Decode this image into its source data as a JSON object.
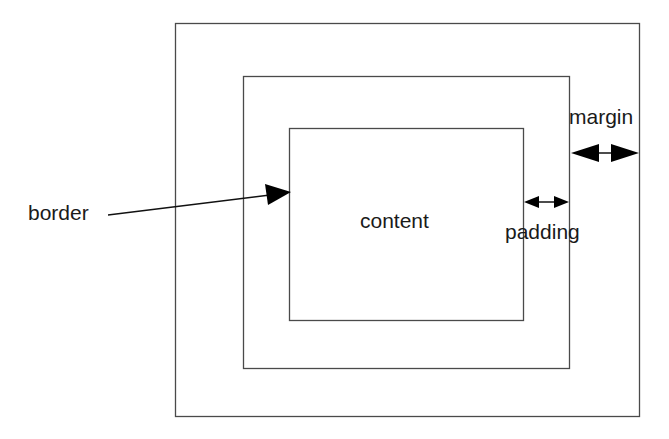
{
  "diagram": {
    "colors": {
      "line": "#4a4a4a",
      "arrow": "#000000",
      "text": "#1a1a1a",
      "background": "#ffffff"
    },
    "boxes": {
      "outer": {
        "name": "margin-edge",
        "x": 175,
        "y": 23,
        "w": 465,
        "h": 394
      },
      "middle": {
        "name": "border-box",
        "x": 243,
        "y": 76,
        "w": 327,
        "h": 293
      },
      "inner": {
        "name": "content-box",
        "x": 289,
        "y": 128,
        "w": 234,
        "h": 193
      }
    },
    "labels": {
      "content": "content",
      "border": "border",
      "padding": "padding",
      "margin": "margin"
    },
    "arrows": {
      "border": {
        "from": [
          108,
          215
        ],
        "to": [
          291,
          192
        ],
        "type": "single"
      },
      "padding": {
        "from": [
          524,
          202
        ],
        "to": [
          569,
          202
        ],
        "type": "double"
      },
      "margin": {
        "from": [
          571,
          153
        ],
        "to": [
          639,
          153
        ],
        "type": "double"
      }
    }
  }
}
